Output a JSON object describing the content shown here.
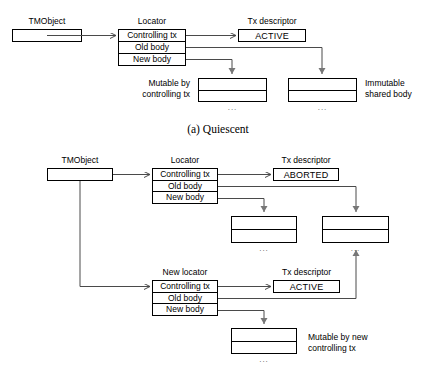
{
  "figure": {
    "caption_a": "(a) Quiescent",
    "ellipsis": "..."
  },
  "panel_a": {
    "tmobject_label": "TMObject",
    "locator_label": "Locator",
    "txdesc_label": "Tx descriptor",
    "locator_rows": [
      "Controlling tx",
      "Old body",
      "New body"
    ],
    "tx_state": "ACTIVE",
    "left_note_line1": "Mutable by",
    "left_note_line2": "controlling tx",
    "right_note_line1": "Immutable",
    "right_note_line2": "shared body"
  },
  "panel_b": {
    "tmobject_label": "TMObject",
    "locator_label": "Locator",
    "txdesc_label": "Tx descriptor",
    "locator_rows": [
      "Controlling tx",
      "Old body",
      "New body"
    ],
    "tx_state": "ABORTED",
    "new_locator_label": "New locator",
    "new_txdesc_label": "Tx descriptor",
    "new_locator_rows": [
      "Controlling tx",
      "Old body",
      "New body"
    ],
    "new_tx_state": "ACTIVE",
    "note_line1": "Mutable by new",
    "note_line2": "controlling tx"
  }
}
